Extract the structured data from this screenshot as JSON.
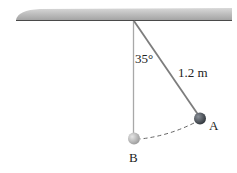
{
  "diagram": {
    "labels": {
      "angle": "35°",
      "length": "1.2 m",
      "point_a": "A",
      "point_b": "B"
    },
    "colors": {
      "ceiling": "#a9a9a9",
      "ceiling_edge": "#555555",
      "string": "#8a8a8a",
      "ball_a": "#4a4f55",
      "ball_b": "#b8b8b8",
      "path": "#666666"
    }
  }
}
